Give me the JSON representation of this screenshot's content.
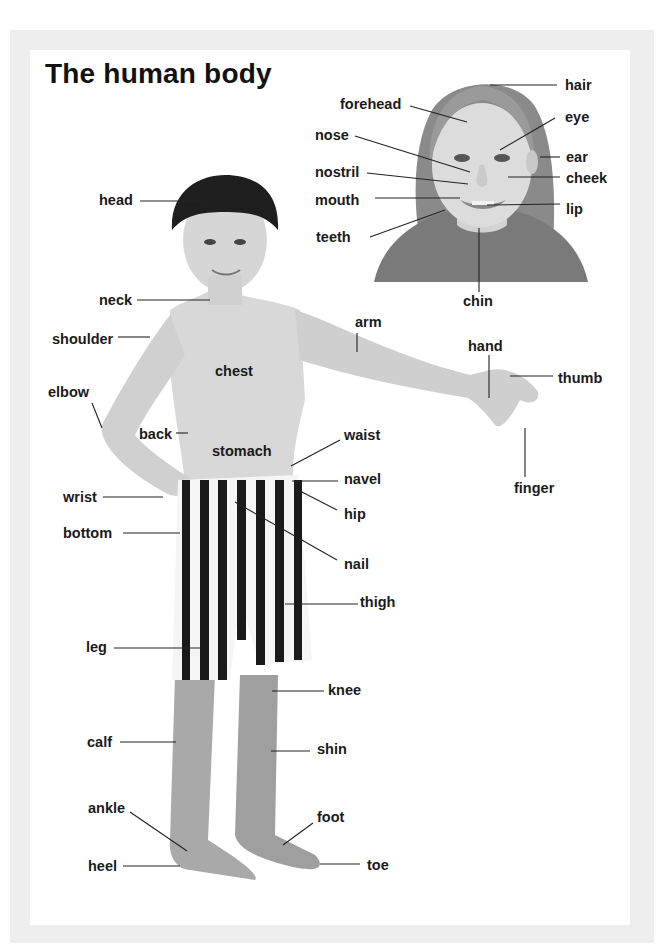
{
  "title": "The human body",
  "face_labels": {
    "hair": "hair",
    "forehead": "forehead",
    "eye": "eye",
    "nose": "nose",
    "ear": "ear",
    "nostril": "nostril",
    "cheek": "cheek",
    "mouth": "mouth",
    "lip": "lip",
    "teeth": "teeth",
    "chin": "chin"
  },
  "body_labels": {
    "head": "head",
    "neck": "neck",
    "shoulder": "shoulder",
    "arm": "arm",
    "hand": "hand",
    "thumb": "thumb",
    "chest": "chest",
    "elbow": "elbow",
    "back": "back",
    "stomach": "stomach",
    "waist": "waist",
    "navel": "navel",
    "finger": "finger",
    "wrist": "wrist",
    "hip": "hip",
    "bottom": "bottom",
    "nail": "nail",
    "thigh": "thigh",
    "leg": "leg",
    "knee": "knee",
    "calf": "calf",
    "shin": "shin",
    "ankle": "ankle",
    "foot": "foot",
    "heel": "heel",
    "toe": "toe"
  },
  "images": {
    "girl_portrait": "girl-face-photo",
    "boy_full_body": "boy-standing-photo"
  }
}
